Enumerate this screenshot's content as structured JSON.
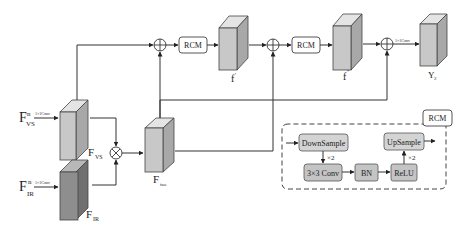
{
  "diagram": {
    "inputs": {
      "vs": {
        "base": "F",
        "sup": "n",
        "sub": "VS",
        "conv": "1×1Conv"
      },
      "ir": {
        "base": "F",
        "sup": "n",
        "sub": "IR",
        "conv": "1×1Conv"
      }
    },
    "features": {
      "f_vs": {
        "base": "F",
        "sub": "VS"
      },
      "f_ir": {
        "base": "F",
        "sub": "IR"
      },
      "f_fuse": {
        "base": "F",
        "sub": "fuse"
      },
      "f_prime": {
        "base": "f",
        "sup": "'"
      },
      "f_dprime": {
        "base": "f",
        "sup": "''"
      },
      "y2": {
        "base": "Y",
        "sub": "2"
      }
    },
    "modules": {
      "rcm1": "RCM",
      "rcm2": "RCM",
      "rcm_legend": "RCM"
    },
    "output_conv": "1×1Conv",
    "rcm_detail": {
      "downsample": "DownSample",
      "conv": "3×3 Conv",
      "bn": "BN",
      "relu": "ReLU",
      "upsample": "UpSample",
      "repeat_down": "×2",
      "repeat_up": "×2"
    },
    "colors": {
      "cube_light_front": "#c8c8c8",
      "cube_light_top": "#e4e4e4",
      "cube_light_side": "#a8a8a8",
      "cube_dark_front": "#8e8e8e",
      "cube_dark_top": "#b8b8b8",
      "cube_dark_side": "#707070",
      "module_fill": "#d4d4d4",
      "rcm_fill": "#ffffff"
    }
  }
}
